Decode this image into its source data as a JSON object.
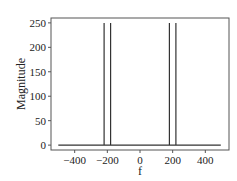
{
  "chart_data": {
    "type": "line",
    "title": "",
    "xlabel": "f",
    "ylabel": "Magnitude",
    "xlim": [
      -545,
      545
    ],
    "ylim": [
      -10,
      260
    ],
    "grid": false,
    "legend": null,
    "xticks": [
      -400,
      -200,
      0,
      200,
      400
    ],
    "xtick_labels": [
      "−400",
      "−200",
      "0",
      "200",
      "400"
    ],
    "yticks": [
      0,
      50,
      100,
      150,
      200,
      250
    ],
    "ytick_labels": [
      "0",
      "50",
      "100",
      "150",
      "200",
      "250"
    ],
    "series": [
      {
        "name": "magnitude spectrum",
        "color": "#333333",
        "x": [
          -500,
          -220,
          -220,
          -220,
          -180,
          -180,
          -180,
          180,
          180,
          180,
          220,
          220,
          220,
          495
        ],
        "y": [
          0,
          0,
          250,
          0,
          0,
          250,
          0,
          0,
          250,
          0,
          0,
          250,
          0,
          0
        ]
      }
    ],
    "peaks": [
      {
        "f": -220,
        "magnitude": 250
      },
      {
        "f": -180,
        "magnitude": 250
      },
      {
        "f": 180,
        "magnitude": 250
      },
      {
        "f": 220,
        "magnitude": 250
      }
    ]
  },
  "colors": {
    "line": "#333333",
    "frame": "#555555",
    "text": "#222222",
    "background": "#ffffff"
  }
}
